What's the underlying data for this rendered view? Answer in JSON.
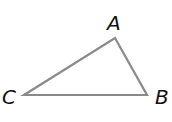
{
  "diagram": {
    "type": "triangle",
    "stroke_color": "#8a8a8a",
    "vertices": [
      {
        "label": "A",
        "x": 115,
        "y": 38
      },
      {
        "label": "B",
        "x": 147,
        "y": 95
      },
      {
        "label": "C",
        "x": 24,
        "y": 95
      }
    ]
  }
}
